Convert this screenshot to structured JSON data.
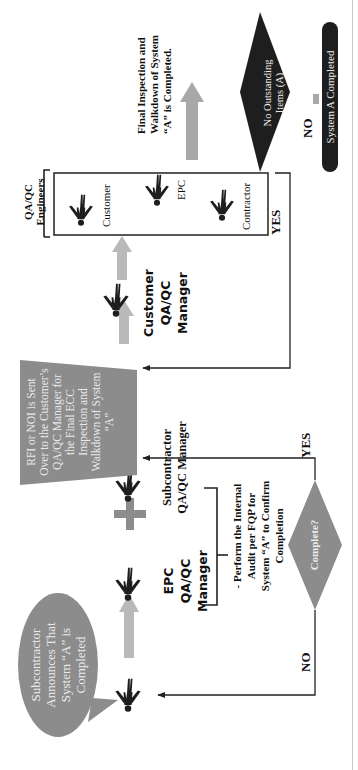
{
  "diagram": {
    "orientation": "rotated-90-ccw",
    "colors": {
      "shape_gray": "#8c8c8c",
      "arrow_gray": "#b9b9b9",
      "dark_shape": "#1e1e1e",
      "line": "#222222",
      "white_text": "#eaeaea"
    },
    "nodes": {
      "speech_bubble": {
        "text": "Subcontractor Announces That System “A” is Completed"
      },
      "epc_manager": {
        "label": "EPC QA/QC Manager"
      },
      "plus_symbol": {
        "label": "+"
      },
      "subcontractor_manager": {
        "label": "Subcontractor QA/QC Manager"
      },
      "audit_note": {
        "text": "- Perform the Internal Audit per FQP for System “A” to Confirm Completion"
      },
      "complete_decision": {
        "label": "Complete?"
      },
      "rfi_trapezoid": {
        "text": "RFI or NOI is Sent Over to the Customer’s QA/QC Manager for the Final ECC Inspection and Walkdown of System “A”"
      },
      "customer_manager": {
        "label": "Customer QA/QC Manager"
      },
      "engineers_group": {
        "title": "QA/QC Engineers",
        "members": [
          "Customer",
          "EPC",
          "Contractor"
        ]
      },
      "final_inspection_note": {
        "text": "Final Inspection and Walkdown of System “A” is Completed."
      },
      "outstanding_decision": {
        "label": "No Outstanding Items (A)"
      },
      "terminal": {
        "label": "System A Completed"
      }
    },
    "edges": [
      {
        "from": "complete_decision",
        "to": "speech_bubble",
        "label": "NO"
      },
      {
        "from": "complete_decision",
        "to": "rfi_trapezoid",
        "label": "YES"
      },
      {
        "from": "engineers_group",
        "to": "rfi_trapezoid",
        "label": "YES"
      },
      {
        "from": "outstanding_decision",
        "to": "terminal",
        "label": "NO"
      }
    ],
    "edge_labels": {
      "no_left": "NO",
      "yes_mid": "YES",
      "yes_right": "YES",
      "no_right": "NO"
    }
  }
}
